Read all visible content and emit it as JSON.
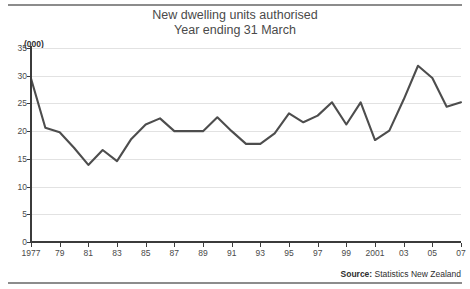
{
  "chart_data": {
    "type": "line",
    "title": "New dwelling units authorised",
    "subtitle": "Year ending 31 March",
    "units_label": "(000)",
    "xlabel": "",
    "ylabel": "",
    "ylim": [
      0,
      35
    ],
    "y_ticks": [
      0,
      5,
      10,
      15,
      20,
      25,
      30,
      35
    ],
    "y_tick_labels": [
      "0",
      "5",
      "10",
      "15",
      "20",
      "25",
      "30",
      "35"
    ],
    "xlim": [
      1977,
      2007
    ],
    "x_ticks": [
      1977,
      1979,
      1981,
      1983,
      1985,
      1987,
      1989,
      1991,
      1993,
      1995,
      1997,
      1999,
      2001,
      2003,
      2005,
      2007
    ],
    "x_tick_labels": [
      "1977",
      "79",
      "81",
      "83",
      "85",
      "87",
      "89",
      "91",
      "93",
      "95",
      "97",
      "99",
      "2001",
      "03",
      "05",
      "07"
    ],
    "grid": true,
    "legend": false,
    "line_color": "#4d4d4d",
    "x": [
      1977,
      1978,
      1979,
      1980,
      1981,
      1982,
      1983,
      1984,
      1985,
      1986,
      1987,
      1988,
      1989,
      1990,
      1991,
      1992,
      1993,
      1994,
      1995,
      1996,
      1997,
      1998,
      1999,
      2000,
      2001,
      2002,
      2003,
      2004,
      2005,
      2006,
      2007
    ],
    "values": [
      29.5,
      20.6,
      19.8,
      17.0,
      13.9,
      16.6,
      14.6,
      18.6,
      21.2,
      22.3,
      20.0,
      20.0,
      20.0,
      22.5,
      20.0,
      17.7,
      17.7,
      19.6,
      23.2,
      21.6,
      22.8,
      25.2,
      21.2,
      25.2,
      18.4,
      20.1,
      25.7,
      31.8,
      29.6,
      24.4,
      25.2
    ],
    "series_name": "New dwelling units authorised"
  },
  "source": {
    "label": "Source:",
    "text": " Statistics New Zealand"
  }
}
